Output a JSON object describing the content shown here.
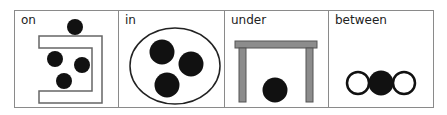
{
  "panels": [
    {
      "id": "on",
      "label": "on"
    },
    {
      "id": "in",
      "label": "in"
    },
    {
      "id": "under",
      "label": "under"
    },
    {
      "id": "between",
      "label": "between"
    }
  ],
  "colors": {
    "border": "#8a8a8a",
    "ball": "#111111",
    "table": "#8c8c8c",
    "table_outline": "#555555"
  }
}
